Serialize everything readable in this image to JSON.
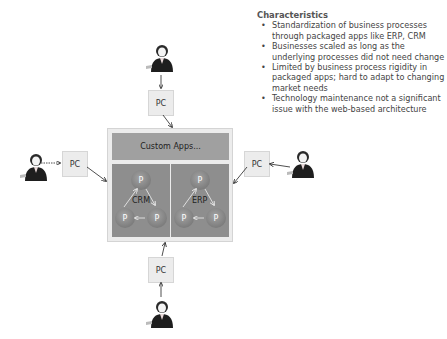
{
  "characteristics": {
    "title": "Characteristics",
    "bullets": [
      "Standardization of business processes through packaged apps like ERP, CRM",
      "Businesses scaled as long as the underlying processes did not need change",
      "Limited by business process rigidity in packaged apps; hard to adapt to changing market needs",
      "Technology maintenance not a significant issue with the web-based architecture"
    ]
  },
  "diagram": {
    "custom_apps_label": "Custom Apps...",
    "groups": [
      {
        "label": "CRM",
        "nodes": [
          "P",
          "P",
          "P"
        ]
      },
      {
        "label": "ERP",
        "nodes": [
          "P",
          "P",
          "P"
        ]
      }
    ],
    "clients": [
      {
        "position": "top",
        "label": "PC"
      },
      {
        "position": "left",
        "label": "PC"
      },
      {
        "position": "right",
        "label": "PC"
      },
      {
        "position": "bottom",
        "label": "PC"
      }
    ]
  },
  "colors": {
    "outer_box": "#ececec",
    "custom_apps_bar": "#a0a0a0",
    "app_panel": "#8e8e8e",
    "pc_box": "#ececec"
  }
}
